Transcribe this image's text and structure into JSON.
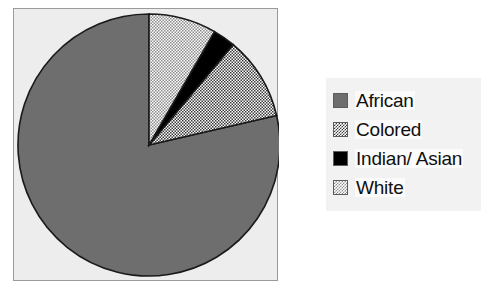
{
  "chart_data": {
    "type": "pie",
    "title": "",
    "subtitle": "",
    "xlabel": "",
    "ylabel": "",
    "grid": false,
    "legend_position": "right",
    "start_angle_deg": 0,
    "direction": "clockwise",
    "categories": [
      "African",
      "Colored",
      "Indian/ Asian",
      "White"
    ],
    "values": [
      78.6,
      10.3,
      2.8,
      8.3
    ],
    "units": "percent",
    "slices": [
      {
        "label": "African",
        "value": 78.6,
        "angle_deg": 283.0,
        "start_deg": 77.0,
        "end_deg": 360.0,
        "fill": "solid-gray",
        "color": "#6E6E6E",
        "swatch": "fill-african"
      },
      {
        "label": "Colored",
        "value": 10.3,
        "angle_deg": 37.0,
        "start_deg": 40.0,
        "end_deg": 77.0,
        "fill": "checker-dither-50",
        "color": "#3A3A3A",
        "swatch": "fill-colored"
      },
      {
        "label": "Indian/ Asian",
        "value": 2.8,
        "angle_deg": 10.0,
        "start_deg": 30.0,
        "end_deg": 40.0,
        "fill": "solid-black",
        "color": "#000000",
        "swatch": "fill-indian"
      },
      {
        "label": "White",
        "value": 8.3,
        "angle_deg": 30.0,
        "start_deg": 0.0,
        "end_deg": 30.0,
        "fill": "checker-dither-25",
        "color": "#8C8C8C",
        "swatch": "fill-white"
      }
    ]
  },
  "plot": {
    "frame_fill": "#EDEDED",
    "frame_border": "#9A9A9A",
    "slice_outline": "#1A1A1A"
  },
  "legend": {
    "background": "#F2F2F2",
    "items": [
      {
        "label": "African"
      },
      {
        "label": "Colored"
      },
      {
        "label": "Indian/ Asian"
      },
      {
        "label": "White"
      }
    ]
  }
}
